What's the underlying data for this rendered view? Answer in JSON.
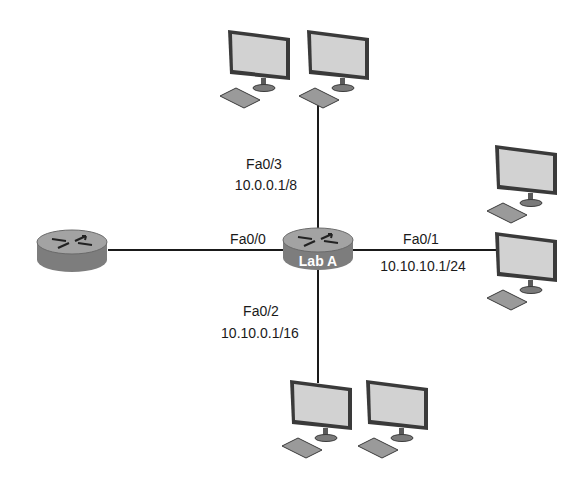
{
  "diagram": {
    "routers": [
      {
        "id": "lab-a",
        "label": "Lab A"
      },
      {
        "id": "remote",
        "label": ""
      }
    ],
    "interfaces": {
      "fa00": {
        "name": "Fa0/0",
        "ip": ""
      },
      "fa01": {
        "name": "Fa0/1",
        "ip": "10.10.10.1/24"
      },
      "fa02": {
        "name": "Fa0/2",
        "ip": "10.10.0.1/16"
      },
      "fa03": {
        "name": "Fa0/3",
        "ip": "10.0.0.1/8"
      }
    },
    "hosts": {
      "top_count": 2,
      "right_count": 2,
      "bottom_count": 2
    },
    "colors": {
      "line": "#1a1a1a",
      "router_body": "#8a8a8a",
      "router_top": "#a6a6a6",
      "screen": "#d2d2d2",
      "frame": "#3a3a3a"
    }
  }
}
